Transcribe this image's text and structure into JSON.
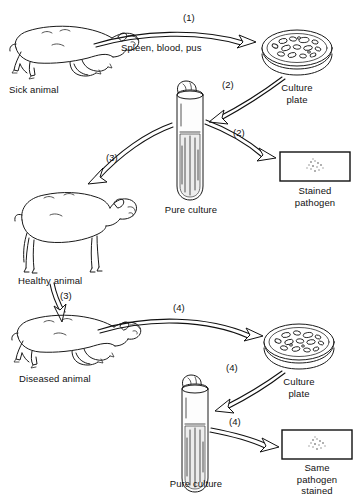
{
  "figure": {
    "ink_color": "#111111",
    "background_color": "#ffffff"
  },
  "labels": {
    "sick_animal": "Sick animal",
    "culture_plate_top": "Culture\nplate",
    "pure_culture_top": "Pure culture",
    "stained_pathogen": "Stained\npathogen",
    "healthy_animal": "Healthy animal",
    "diseased_animal": "Diseased animal",
    "culture_plate_bottom": "Culture\nplate",
    "pure_culture_bottom": "Pure culture",
    "same_pathogen_stained": "Same\npathogen\nstained",
    "specimen_text": "Spleen, blood, pus"
  },
  "steps": {
    "s1": "(1)",
    "s2a": "(2)",
    "s2b": "(2)",
    "s3a": "(3)",
    "s3b": "(3)",
    "s4a": "(4)",
    "s4b": "(4)",
    "s4c": "(4)"
  },
  "icons": {
    "sick_animal": "sick-sheep-icon",
    "culture_plate": "petri-dish-icon",
    "test_tube": "test-tube-icon",
    "microscope_slide": "microscope-slide-icon",
    "healthy_animal": "standing-sheep-icon",
    "diseased_animal": "collapsed-sheep-icon"
  },
  "arrows": [
    {
      "name": "sick-animal-to-culture-plate",
      "step": "(1)",
      "caption": "Spleen, blood, pus"
    },
    {
      "name": "culture-plate-to-pure-culture",
      "step": "(2)",
      "caption": ""
    },
    {
      "name": "pure-culture-to-stained-pathogen",
      "step": "(2)",
      "caption": ""
    },
    {
      "name": "pure-culture-to-healthy-animal",
      "step": "(3)",
      "caption": ""
    },
    {
      "name": "healthy-animal-to-diseased-animal",
      "step": "(3)",
      "caption": ""
    },
    {
      "name": "diseased-animal-to-culture-plate",
      "step": "(4)",
      "caption": ""
    },
    {
      "name": "culture-plate-to-pure-culture-2",
      "step": "(4)",
      "caption": ""
    },
    {
      "name": "pure-culture-to-same-pathogen-stained",
      "step": "(4)",
      "caption": ""
    }
  ]
}
